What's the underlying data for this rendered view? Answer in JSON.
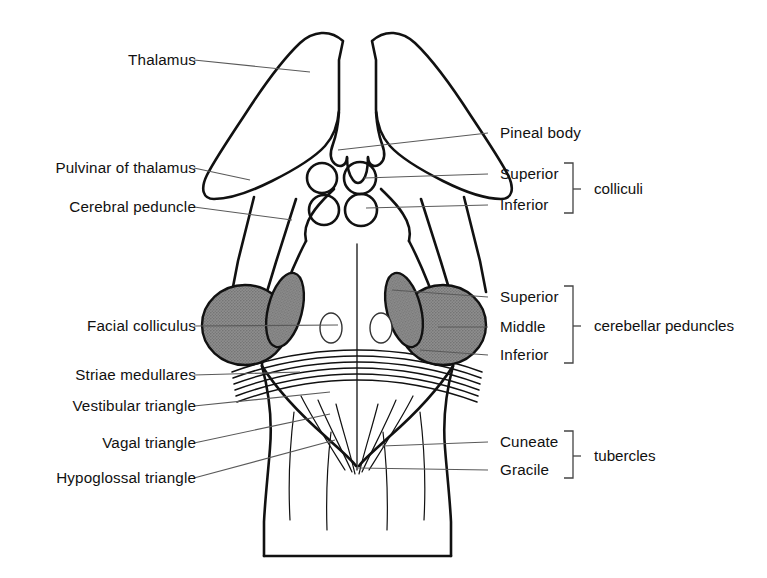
{
  "figure": {
    "background_color": "#ffffff",
    "ink_color": "#111111",
    "shade_fill_color": "#8a8a8a",
    "leader_color": "#5a5a5a"
  },
  "labels_left": [
    {
      "id": "thalamus",
      "text": "Thalamus",
      "x": 104,
      "y": 60,
      "text_right": 196,
      "leader_x2": 310,
      "leader_y2": 72
    },
    {
      "id": "pulvinar",
      "text": "Pulvinar of thalamus",
      "x": 24,
      "y": 168,
      "text_right": 196,
      "leader_x2": 250,
      "leader_y2": 180
    },
    {
      "id": "cerebral-peduncle",
      "text": "Cerebral peduncle",
      "x": 40,
      "y": 207,
      "text_right": 196,
      "leader_x2": 292,
      "leader_y2": 220
    },
    {
      "id": "facial-colliculus",
      "text": "Facial colliculus",
      "x": 58,
      "y": 326,
      "text_right": 196,
      "leader_x2": 338,
      "leader_y2": 325
    },
    {
      "id": "striae-medullares",
      "text": "Striae medullares",
      "x": 48,
      "y": 375,
      "text_right": 196,
      "leader_x2": 300,
      "leader_y2": 372
    },
    {
      "id": "vestibular-triangle",
      "text": "Vestibular triangle",
      "x": 37,
      "y": 406,
      "text_right": 196,
      "leader_x2": 330,
      "leader_y2": 392
    },
    {
      "id": "vagal-triangle",
      "text": "Vagal triangle",
      "x": 72,
      "y": 443,
      "text_right": 196,
      "leader_x2": 330,
      "leader_y2": 414
    },
    {
      "id": "hypoglossal-triangle",
      "text": "Hypoglossal triangle",
      "x": 26,
      "y": 478,
      "text_right": 196,
      "leader_x2": 335,
      "leader_y2": 440
    }
  ],
  "labels_right": [
    {
      "id": "pineal-body",
      "text": "Pineal body",
      "x": 500,
      "y": 133,
      "leader_x1": 488,
      "leader_x2": 338,
      "leader_y2": 150
    },
    {
      "id": "colliculus-superior",
      "text": "Superior",
      "x": 500,
      "y": 174,
      "leader_x1": 488,
      "leader_x2": 364,
      "leader_y2": 178
    },
    {
      "id": "colliculus-inferior",
      "text": "Inferior",
      "x": 500,
      "y": 205,
      "leader_x1": 488,
      "leader_x2": 366,
      "leader_y2": 208
    },
    {
      "id": "peduncle-superior",
      "text": "Superior",
      "x": 500,
      "y": 297,
      "leader_x1": 488,
      "leader_x2": 392,
      "leader_y2": 290
    },
    {
      "id": "peduncle-middle",
      "text": "Middle",
      "x": 500,
      "y": 327,
      "leader_x1": 488,
      "leader_x2": 438,
      "leader_y2": 327
    },
    {
      "id": "peduncle-inferior",
      "text": "Inferior",
      "x": 500,
      "y": 355,
      "leader_x1": 488,
      "leader_x2": 420,
      "leader_y2": 350
    },
    {
      "id": "tubercle-cuneate",
      "text": "Cuneate",
      "x": 500,
      "y": 442,
      "leader_x1": 488,
      "leader_x2": 382,
      "leader_y2": 446
    },
    {
      "id": "tubercle-gracile",
      "text": "Gracile",
      "x": 500,
      "y": 470,
      "leader_x1": 488,
      "leader_x2": 358,
      "leader_y2": 468
    }
  ],
  "groups": [
    {
      "id": "colliculi",
      "text": "colliculi",
      "x": 594,
      "y": 189,
      "bracket_x": 573,
      "bracket_top": 163,
      "bracket_bottom": 213,
      "tick_y": 189
    },
    {
      "id": "cerebellar-peduncles",
      "text": "cerebellar peduncles",
      "x": 594,
      "y": 326,
      "bracket_x": 573,
      "bracket_top": 286,
      "bracket_bottom": 363,
      "tick_y": 326
    },
    {
      "id": "tubercles",
      "text": "tubercles",
      "x": 594,
      "y": 456,
      "bracket_x": 573,
      "bracket_top": 431,
      "bracket_bottom": 478,
      "tick_y": 456
    }
  ],
  "structures": [
    {
      "id": "thalamus-left",
      "kind": "outline"
    },
    {
      "id": "thalamus-right",
      "kind": "outline"
    },
    {
      "id": "pineal-body",
      "kind": "outline"
    },
    {
      "id": "superior-colliculus-left",
      "kind": "circle"
    },
    {
      "id": "superior-colliculus-right",
      "kind": "circle"
    },
    {
      "id": "inferior-colliculus-left",
      "kind": "circle"
    },
    {
      "id": "inferior-colliculus-right",
      "kind": "circle"
    },
    {
      "id": "middle-cerebellar-peduncle-left",
      "kind": "shaded-oval"
    },
    {
      "id": "middle-cerebellar-peduncle-right",
      "kind": "shaded-oval"
    },
    {
      "id": "superior-cerebellar-peduncle-left",
      "kind": "shaded-oval"
    },
    {
      "id": "superior-cerebellar-peduncle-right",
      "kind": "shaded-oval"
    },
    {
      "id": "facial-colliculus-left",
      "kind": "small-oval"
    },
    {
      "id": "facial-colliculus-right",
      "kind": "small-oval"
    },
    {
      "id": "striae-medullares",
      "kind": "striation-lines",
      "count": 6
    },
    {
      "id": "medulla",
      "kind": "outline"
    }
  ]
}
